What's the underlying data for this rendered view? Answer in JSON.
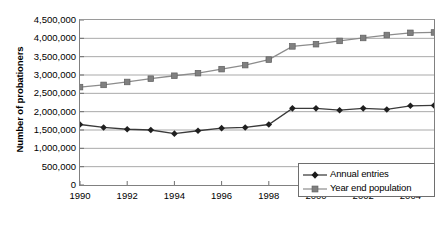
{
  "chart_data": {
    "type": "line",
    "title": "",
    "xlabel": "",
    "ylabel": "Number of probationers",
    "x": [
      1990,
      1991,
      1992,
      1993,
      1994,
      1995,
      1996,
      1997,
      1998,
      1999,
      2000,
      2001,
      2002,
      2003,
      2004,
      2005
    ],
    "xlim": [
      1990,
      2005
    ],
    "ylim": [
      0,
      4500000
    ],
    "grid": true,
    "legend_position": "bottom-right",
    "x_tick_labels": [
      "1990",
      "1992",
      "1994",
      "1996",
      "1998",
      "2000",
      "2002",
      "2004"
    ],
    "x_tick_values": [
      1990,
      1992,
      1994,
      1996,
      1998,
      2000,
      2002,
      2004
    ],
    "y_tick_labels": [
      "0",
      "500,000",
      "1,000,000",
      "1,500,000",
      "2,000,000",
      "2,500,000",
      "3,000,000",
      "3,500,000",
      "4,000,000",
      "4,500,000"
    ],
    "y_tick_values": [
      0,
      500000,
      1000000,
      1500000,
      2000000,
      2500000,
      3000000,
      3500000,
      4000000,
      4500000
    ],
    "series": [
      {
        "name": "Annual entries",
        "marker": "diamond",
        "color": "#333333",
        "values": [
          1650000,
          1570000,
          1520000,
          1500000,
          1400000,
          1480000,
          1550000,
          1570000,
          1650000,
          2090000,
          2090000,
          2040000,
          2090000,
          2060000,
          2160000,
          2170000
        ]
      },
      {
        "name": "Year end population",
        "marker": "square",
        "color": "#808080",
        "values": [
          2670000,
          2730000,
          2810000,
          2900000,
          2980000,
          3050000,
          3160000,
          3270000,
          3420000,
          3780000,
          3840000,
          3930000,
          4010000,
          4090000,
          4150000,
          4160000
        ]
      }
    ]
  },
  "legend": {
    "items": [
      {
        "label": "Annual entries"
      },
      {
        "label": "Year end population"
      }
    ]
  }
}
